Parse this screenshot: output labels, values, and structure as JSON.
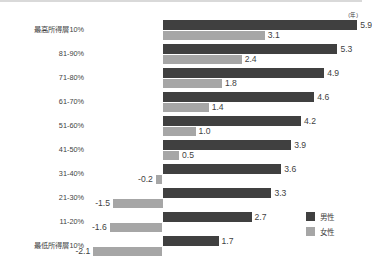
{
  "chart_data": {
    "type": "bar",
    "orientation": "horizontal",
    "title": "",
    "xlabel": "",
    "ylabel": "",
    "unit_label": "(年)",
    "grid": false,
    "legend_position": "bottom-right",
    "zero_axis": true,
    "categories": [
      "最高所得層10%",
      "81-90%",
      "71-80%",
      "61-70%",
      "51-60%",
      "41-50%",
      "31-40%",
      "21-30%",
      "11-20%",
      "最低所得層10%"
    ],
    "series": [
      {
        "name": "男性",
        "color": "#404040",
        "values": [
          5.9,
          5.3,
          4.9,
          4.6,
          4.2,
          3.9,
          3.6,
          3.3,
          2.7,
          1.7
        ],
        "labels": [
          "5.9",
          "5.3",
          "4.9",
          "4.6",
          "4.2",
          "3.9",
          "3.6",
          "3.3",
          "2.7",
          "1.7"
        ]
      },
      {
        "name": "女性",
        "color": "#a6a6a6",
        "values": [
          3.1,
          2.4,
          1.8,
          1.4,
          1.0,
          0.5,
          -0.2,
          -1.5,
          -1.6,
          -2.1
        ],
        "labels": [
          "3.1",
          "2.4",
          "1.8",
          "1.4",
          "1.0",
          "0.5",
          "-0.2",
          "-1.5",
          "-1.6",
          "-2.1"
        ]
      }
    ],
    "xlim": [
      -2.6,
      6.2
    ]
  },
  "legend": {
    "items": [
      {
        "label": "男性",
        "color": "#404040"
      },
      {
        "label": "女性",
        "color": "#a6a6a6"
      }
    ]
  }
}
